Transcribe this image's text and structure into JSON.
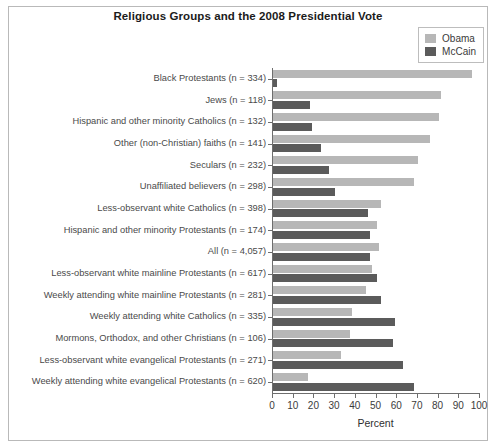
{
  "chart_data": {
    "type": "bar",
    "orientation": "horizontal",
    "title": "Religious Groups and the 2008 Presidential Vote",
    "xlabel": "Percent",
    "ylabel": "",
    "xlim": [
      0,
      100
    ],
    "xticks": [
      0,
      10,
      20,
      30,
      40,
      50,
      60,
      70,
      80,
      90,
      100
    ],
    "grid": false,
    "legend_position": "top-right",
    "categories": [
      "Black Protestants (n = 334)",
      "Jews (n = 118)",
      "Hispanic and other minority Catholics (n = 132)",
      "Other (non-Christian) faiths (n = 141)",
      "Seculars (n = 232)",
      "Unaffiliated believers (n = 298)",
      "Less-observant white Catholics (n = 398)",
      "Hispanic and other minority Protestants (n = 174)",
      "All (n = 4,057)",
      "Less-observant white mainline Protestants (n = 617)",
      "Weekly attending white mainline Protestants (n = 281)",
      "Weekly attending white Catholics (n = 335)",
      "Mormons, Orthodox, and other Christians (n = 106)",
      "Less-observant white evangelical Protestants (n = 271)",
      "Weekly attending white evangelical Protestants (n = 620)"
    ],
    "series": [
      {
        "name": "Obama",
        "color": "#b7b7b7",
        "values": [
          96,
          81,
          80,
          76,
          70,
          68,
          52,
          50,
          51,
          48,
          45,
          38,
          37,
          33,
          17
        ]
      },
      {
        "name": "McCain",
        "color": "#5b5b5b",
        "values": [
          2,
          18,
          19,
          23,
          27,
          30,
          46,
          47,
          47,
          50,
          52,
          59,
          58,
          63,
          68
        ]
      }
    ]
  },
  "legend": {
    "items": [
      {
        "label": "Obama",
        "color": "#b7b7b7"
      },
      {
        "label": "McCain",
        "color": "#5b5b5b"
      }
    ]
  }
}
